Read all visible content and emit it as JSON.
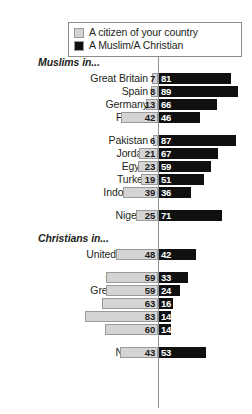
{
  "legend": {
    "items": [
      {
        "label": "A citizen of your country",
        "color": "#d4d4d4",
        "swatch_name": "legend-swatch-citizen"
      },
      {
        "label": "A Muslim/A Christian",
        "color": "#101010",
        "swatch_name": "legend-swatch-religion"
      }
    ]
  },
  "chart_data": {
    "type": "bar",
    "orientation": "horizontal",
    "subtype": "diverging-paired",
    "title": "",
    "xlabel": "",
    "ylabel": "",
    "grid": false,
    "legend_position": "top",
    "xlim": [
      0,
      90
    ],
    "series": [
      {
        "name": "A citizen of your country",
        "color": "#d4d4d4",
        "direction": "left"
      },
      {
        "name": "A Muslim/A Christian",
        "color": "#101010",
        "direction": "right"
      }
    ],
    "groups": [
      {
        "header": "Muslims in...",
        "rows": [
          {
            "category": "Great Britain",
            "left": 7,
            "right": 81
          },
          {
            "category": "Spain",
            "left": 8,
            "right": 89
          },
          {
            "category": "Germany",
            "left": 13,
            "right": 66
          },
          {
            "category": "France",
            "left": 42,
            "right": 46
          }
        ]
      },
      {
        "header": "",
        "rows": [
          {
            "category": "Pakistan",
            "left": 6,
            "right": 87
          },
          {
            "category": "Jordan",
            "left": 21,
            "right": 67
          },
          {
            "category": "Egypt",
            "left": 23,
            "right": 59
          },
          {
            "category": "Turkey",
            "left": 19,
            "right": 51
          },
          {
            "category": "Indonesia",
            "left": 39,
            "right": 36
          }
        ]
      },
      {
        "header": "",
        "rows": [
          {
            "category": "Nigeria",
            "left": 25,
            "right": 71
          }
        ]
      },
      {
        "header": "Christians in...",
        "rows": [
          {
            "category": "United States",
            "left": 48,
            "right": 42
          }
        ]
      },
      {
        "header": "",
        "rows": [
          {
            "category": "Germany",
            "left": 59,
            "right": 33
          },
          {
            "category": "Great Britain",
            "left": 59,
            "right": 24
          },
          {
            "category": "Russia",
            "left": 63,
            "right": 16
          },
          {
            "category": "France",
            "left": 83,
            "right": 14
          },
          {
            "category": "Spain",
            "left": 60,
            "right": 14
          }
        ]
      },
      {
        "header": "",
        "rows": [
          {
            "category": "Nigeria",
            "left": 43,
            "right": 53
          }
        ]
      }
    ]
  }
}
